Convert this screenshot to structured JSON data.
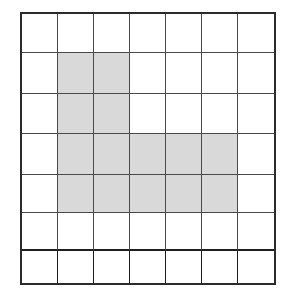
{
  "figure": {
    "grid": {
      "rows": 7,
      "columns": 7,
      "shaded_count": 14,
      "unshaded_count": 35,
      "total_cells": 49,
      "colors": {
        "shaded_fill": "#d9d9d9",
        "unshaded_fill": "#ffffff",
        "interior_line": "#4a4a4a",
        "outer_border": "#2b2b2b",
        "bottom_band_line": "#1e1e1e"
      },
      "shaded_cells": [
        {
          "row": 2,
          "col": 2
        },
        {
          "row": 2,
          "col": 3
        },
        {
          "row": 3,
          "col": 2
        },
        {
          "row": 3,
          "col": 3
        },
        {
          "row": 4,
          "col": 2
        },
        {
          "row": 4,
          "col": 3
        },
        {
          "row": 4,
          "col": 4
        },
        {
          "row": 4,
          "col": 5
        },
        {
          "row": 4,
          "col": 6
        },
        {
          "row": 5,
          "col": 2
        },
        {
          "row": 5,
          "col": 3
        },
        {
          "row": 5,
          "col": 4
        },
        {
          "row": 5,
          "col": 5
        },
        {
          "row": 5,
          "col": 6
        }
      ],
      "cells": [
        [
          false,
          false,
          false,
          false,
          false,
          false,
          false
        ],
        [
          false,
          true,
          true,
          false,
          false,
          false,
          false
        ],
        [
          false,
          true,
          true,
          false,
          false,
          false,
          false
        ],
        [
          false,
          true,
          true,
          true,
          true,
          true,
          false
        ],
        [
          false,
          true,
          true,
          true,
          true,
          true,
          false
        ],
        [
          false,
          false,
          false,
          false,
          false,
          false,
          false
        ],
        [
          false,
          false,
          false,
          false,
          false,
          false,
          false
        ]
      ],
      "row_shaded_counts": [
        0,
        2,
        2,
        5,
        5,
        0,
        0
      ],
      "column_shaded_counts": [
        0,
        4,
        4,
        2,
        2,
        2,
        0
      ]
    }
  }
}
